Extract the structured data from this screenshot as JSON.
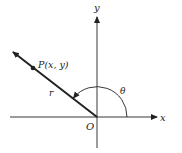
{
  "diagram": {
    "axes": {
      "x_label": "x",
      "y_label": "y",
      "origin_label": "O"
    },
    "point_label": "P(x, y)",
    "radius_label": "r",
    "angle_label": "θ",
    "colors": {
      "stroke": "#222222",
      "background": "#ffffff"
    }
  }
}
